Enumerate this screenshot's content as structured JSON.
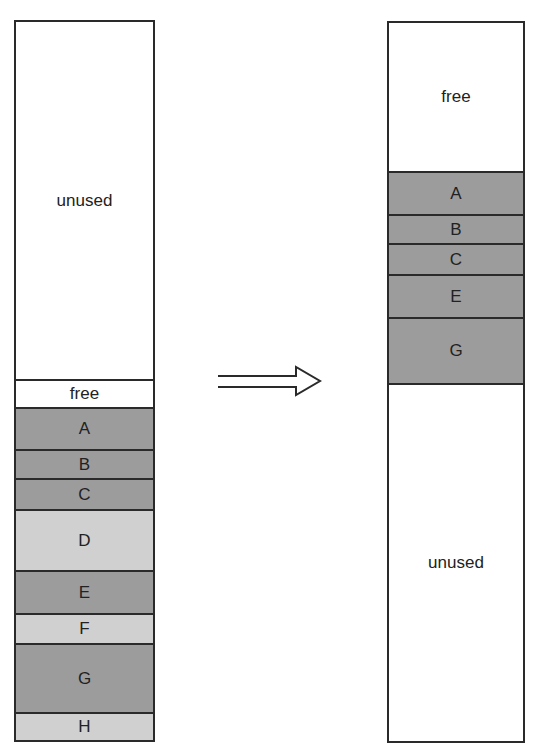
{
  "diagram": {
    "colors": {
      "allocated": "#9c9c9c",
      "freed": "#d0d0d0",
      "empty": "#ffffff",
      "border": "#2a2a2a"
    },
    "before": {
      "segments": [
        {
          "label": "unused",
          "kind": "empty",
          "top": 0,
          "height": 357
        },
        {
          "label": "free",
          "kind": "empty",
          "top": 357,
          "height": 28
        },
        {
          "label": "A",
          "kind": "allocated",
          "top": 385,
          "height": 42
        },
        {
          "label": "B",
          "kind": "allocated",
          "top": 427,
          "height": 29
        },
        {
          "label": "C",
          "kind": "allocated",
          "top": 456,
          "height": 31
        },
        {
          "label": "D",
          "kind": "freed",
          "top": 487,
          "height": 61
        },
        {
          "label": "E",
          "kind": "allocated",
          "top": 548,
          "height": 43
        },
        {
          "label": "F",
          "kind": "freed",
          "top": 591,
          "height": 30
        },
        {
          "label": "G",
          "kind": "allocated",
          "top": 621,
          "height": 69
        },
        {
          "label": "H",
          "kind": "freed",
          "top": 690,
          "height": 28
        }
      ]
    },
    "arrow": {
      "direction": "right",
      "label": ""
    },
    "after": {
      "segments": [
        {
          "label": "free",
          "kind": "empty",
          "top": 0,
          "height": 148
        },
        {
          "label": "A",
          "kind": "allocated",
          "top": 148,
          "height": 43
        },
        {
          "label": "B",
          "kind": "allocated",
          "top": 191,
          "height": 29
        },
        {
          "label": "C",
          "kind": "allocated",
          "top": 220,
          "height": 31
        },
        {
          "label": "E",
          "kind": "allocated",
          "top": 251,
          "height": 43
        },
        {
          "label": "G",
          "kind": "allocated",
          "top": 294,
          "height": 66
        },
        {
          "label": "unused",
          "kind": "empty",
          "top": 360,
          "height": 358
        }
      ]
    }
  }
}
